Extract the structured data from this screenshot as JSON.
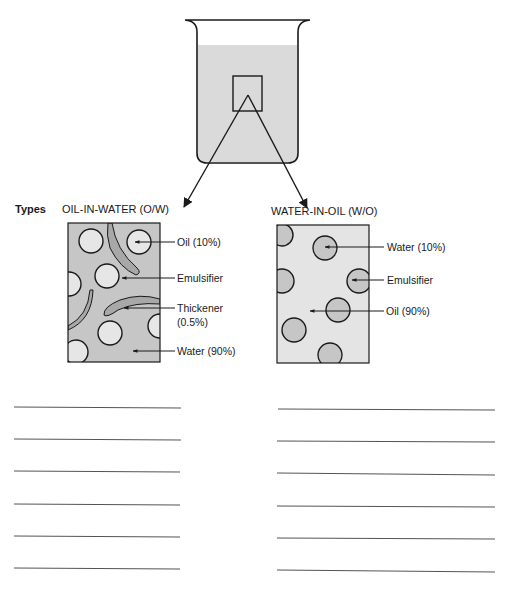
{
  "header": {
    "types_label": "Types"
  },
  "colors": {
    "line": "#1a1a1a",
    "beaker_liquid": "#dadada",
    "ow_continuous": "#c6c6c6",
    "ow_dispersed": "#e6e6e6",
    "ow_thickener": "#a8a8a8",
    "wo_continuous": "#e4e4e4",
    "wo_dispersed": "#c6c6c6",
    "answer_line": "#555555"
  },
  "oil_in_water": {
    "title": "OIL-IN-WATER (O/W)",
    "labels": {
      "oil": "Oil (10%)",
      "emulsifier": "Emulsifier",
      "thickener_1": "Thickener",
      "thickener_2": "(0.5%)",
      "water": "Water (90%)"
    }
  },
  "water_in_oil": {
    "title": "WATER-IN-OIL (W/O)",
    "labels": {
      "water": "Water (10%)",
      "emulsifier": "Emulsifier",
      "oil": "Oil (90%)"
    }
  },
  "answer_lines": {
    "left_count": 6,
    "right_count": 6
  }
}
